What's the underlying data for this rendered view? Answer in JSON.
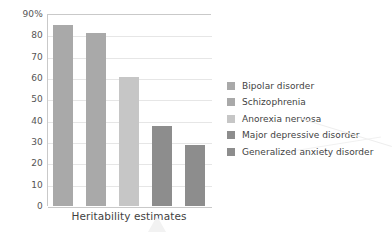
{
  "chart_data": {
    "type": "bar",
    "title": "",
    "subtitle": "",
    "xlabel": "Heritability estimates",
    "ylabel": "",
    "categories": [
      "Bipolar disorder",
      "Schizophrenia",
      "Anorexia nervosa",
      "Major depressive disorder",
      "Generalized anxiety disorder"
    ],
    "values": [
      85,
      81,
      60.5,
      37.5,
      28.5
    ],
    "ylim": [
      0,
      90
    ],
    "yticks": [
      0,
      10,
      20,
      30,
      40,
      50,
      60,
      70,
      80,
      90
    ],
    "ytick_labels": [
      "0",
      "10",
      "20",
      "30",
      "40",
      "50",
      "60",
      "70",
      "80",
      "90%"
    ],
    "grid": true,
    "legend_position": "right",
    "bar_colors": [
      "#a9a9a9",
      "#a9a9a9",
      "#c6c6c6",
      "#8d8d8d",
      "#8d8d8d"
    ],
    "legend": [
      {
        "label": "Bipolar disorder",
        "color": "#a9a9a9"
      },
      {
        "label": "Schizophrenia",
        "color": "#a9a9a9"
      },
      {
        "label": "Anorexia nervosa",
        "color": "#c6c6c6"
      },
      {
        "label": "Major depressive disorder",
        "color": "#8d8d8d"
      },
      {
        "label": "Generalized anxiety disorder",
        "color": "#8d8d8d"
      }
    ]
  },
  "axis": {
    "x_title": "Heritability estimates"
  },
  "colors": {
    "gridline": "#e6e6e6",
    "axis_line": "#c9c9c9",
    "text": "#3f3f3f",
    "background": "#ffffff"
  }
}
